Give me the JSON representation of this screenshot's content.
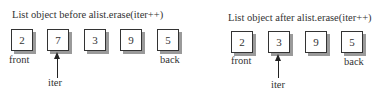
{
  "before": {
    "title": "List object before alist.erase(iter++)",
    "nodes": [
      "2",
      "7",
      "3",
      "9",
      "5"
    ],
    "front_label": "front",
    "back_label": "back",
    "iter_label": "iter",
    "iter_points_to_index": 1
  },
  "after": {
    "title": "List object after alist.erase(iter++)",
    "nodes": [
      "2",
      "3",
      "9",
      "5"
    ],
    "front_label": "front",
    "back_label": "back",
    "iter_label": "iter",
    "iter_points_to_index": 1
  }
}
